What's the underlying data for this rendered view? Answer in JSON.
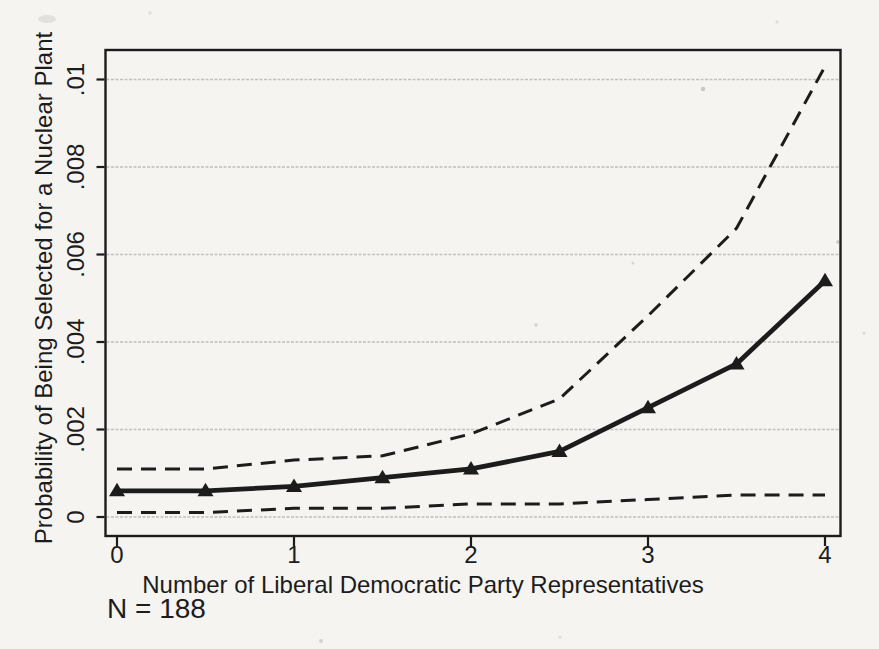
{
  "figure": {
    "sample_size_note": "N = 188"
  },
  "chart_data": {
    "type": "line",
    "title": "",
    "xlabel": "Number of Liberal Democratic Party Representatives",
    "ylabel": "Probability of Being Selected for a Nuclear Plant",
    "x": [
      0,
      0.5,
      1,
      1.5,
      2,
      2.5,
      3,
      3.5,
      4
    ],
    "series": [
      {
        "name": "Predicted probability",
        "style": "solid",
        "marker": "triangle",
        "values": [
          0.0006,
          0.0006,
          0.0007,
          0.0009,
          0.0011,
          0.0015,
          0.0025,
          0.0035,
          0.0054
        ]
      },
      {
        "name": "Upper confidence bound",
        "style": "dashed",
        "marker": "none",
        "values": [
          0.0011,
          0.0011,
          0.0013,
          0.0014,
          0.0019,
          0.0027,
          0.0046,
          0.0066,
          0.0103
        ]
      },
      {
        "name": "Lower confidence bound",
        "style": "dashed",
        "marker": "none",
        "values": [
          0.0001,
          0.0001,
          0.0002,
          0.0002,
          0.0003,
          0.0003,
          0.0004,
          0.0005,
          0.0005
        ]
      }
    ],
    "xticks": [
      0,
      1,
      2,
      3,
      4
    ],
    "xtick_labels": [
      "0",
      "1",
      "2",
      "3",
      "4"
    ],
    "yticks": [
      0,
      0.002,
      0.004,
      0.006,
      0.008,
      0.01
    ],
    "ytick_labels": [
      "0",
      ".002",
      ".004",
      ".006",
      ".008",
      ".01"
    ],
    "xlim": [
      0,
      4
    ],
    "ylim": [
      0,
      0.0105
    ],
    "grid": true,
    "legend": "none",
    "annotation": "N = 188",
    "colors": {
      "ink": "#1c1c1c",
      "grid": "#b9b7b3",
      "paper": "#f5f4f1"
    }
  }
}
